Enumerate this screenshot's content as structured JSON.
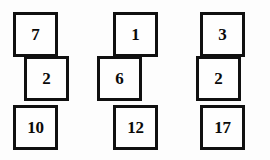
{
  "diagram": {
    "background_color": "#fdfdfd",
    "block_fill_color": "#fefefe",
    "block_border_color": "#101010",
    "text_color": "#0a0a0a",
    "block_size": 45,
    "border_width": 3,
    "stacks": [
      {
        "name": "stack-1",
        "blocks": [
          {
            "value": "7",
            "x": 13,
            "y": 12,
            "row": 0,
            "align": "left"
          },
          {
            "value": "2",
            "x": 24,
            "y": 56,
            "row": 1,
            "align": "right"
          },
          {
            "value": "10",
            "x": 13,
            "y": 105,
            "row": 2,
            "align": "left"
          }
        ]
      },
      {
        "name": "stack-2",
        "blocks": [
          {
            "value": "1",
            "x": 113,
            "y": 12,
            "row": 0,
            "align": "right"
          },
          {
            "value": "6",
            "x": 97,
            "y": 56,
            "row": 1,
            "align": "left"
          },
          {
            "value": "12",
            "x": 113,
            "y": 105,
            "row": 2,
            "align": "right"
          }
        ]
      },
      {
        "name": "stack-3",
        "blocks": [
          {
            "value": "3",
            "x": 200,
            "y": 12,
            "row": 0,
            "align": "right"
          },
          {
            "value": "2",
            "x": 196,
            "y": 56,
            "row": 1,
            "align": "left"
          },
          {
            "value": "17",
            "x": 200,
            "y": 105,
            "row": 2,
            "align": "right"
          }
        ]
      }
    ]
  }
}
